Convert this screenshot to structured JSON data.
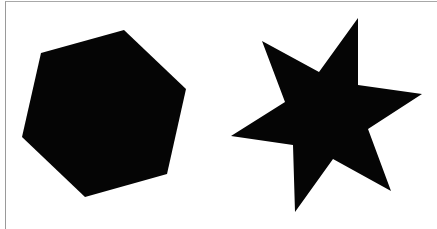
{
  "figure": {
    "background": "#ffffff",
    "frame_color": "#a0a0a0",
    "shapes": [
      {
        "name": "hexagon",
        "fill": "#050505",
        "points": "124,30 186,89 167,174 85,197 22,137 41,53"
      },
      {
        "name": "six-pointed-star",
        "fill": "#050505",
        "points": "358,18 358,85 422,94 368,129 391,191 333,159 295,212 293,145 231,136 285,102 262,41 319,72"
      }
    ]
  }
}
